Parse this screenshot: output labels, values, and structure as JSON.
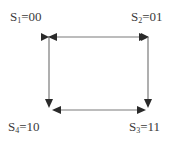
{
  "diagram": {
    "type": "state-transition",
    "colors": {
      "line": "#7a7a7a",
      "arrowhead": "#2a2a2a",
      "text": "#3a3a3a",
      "background": "#ffffff"
    },
    "states": [
      {
        "id": "S1",
        "letter": "S",
        "index": "1",
        "code": "00",
        "position": "top-left"
      },
      {
        "id": "S2",
        "letter": "S",
        "index": "2",
        "code": "01",
        "position": "top-right"
      },
      {
        "id": "S3",
        "letter": "S",
        "index": "3",
        "code": "11",
        "position": "bottom-right"
      },
      {
        "id": "S4",
        "letter": "S",
        "index": "4",
        "code": "10",
        "position": "bottom-left"
      }
    ],
    "transitions": [
      {
        "from": "S1",
        "to": "S2",
        "bidirectional": true
      },
      {
        "from": "S1",
        "to": "S4",
        "bidirectional": false
      },
      {
        "from": "S2",
        "to": "S3",
        "bidirectional": false
      },
      {
        "from": "S4",
        "to": "S3",
        "bidirectional": true
      }
    ]
  }
}
